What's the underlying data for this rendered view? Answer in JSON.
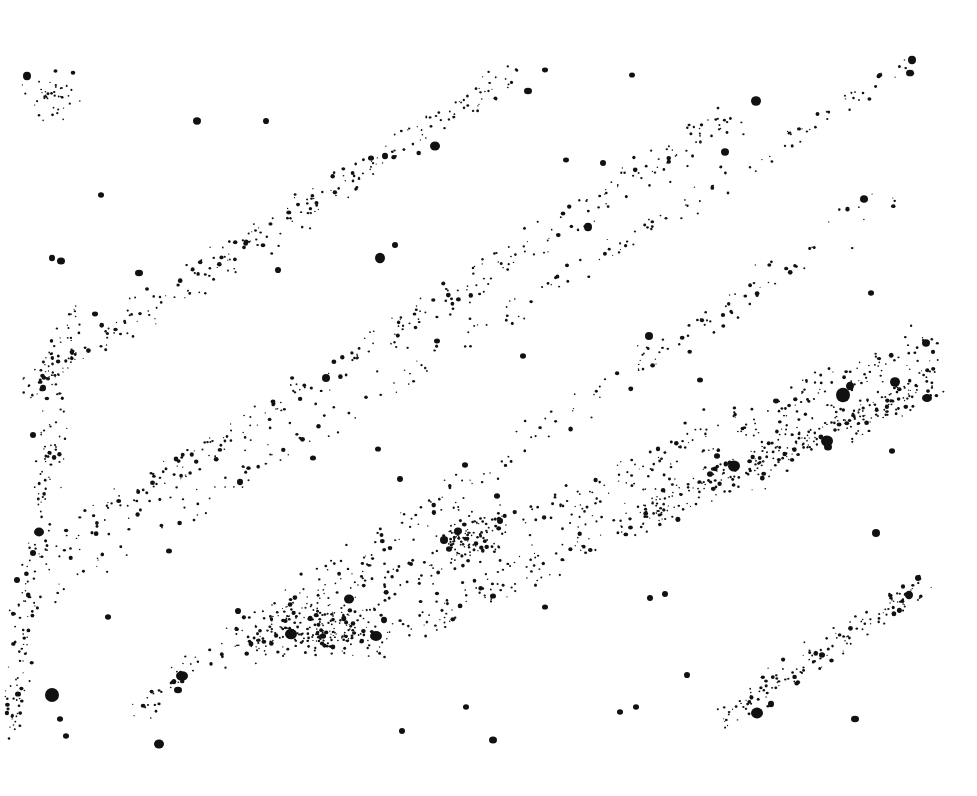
{
  "image": {
    "description": "Stippled ink-dot drawing of a star field; dots arranged in diagonal streams rising from lower-left to upper-right",
    "background": "#ffffff",
    "ink": "#111111",
    "width": 977,
    "height": 796
  },
  "large_dots": [
    [
      27,
      76,
      4
    ],
    [
      197,
      121,
      4
    ],
    [
      266,
      121,
      3
    ],
    [
      435,
      146,
      5
    ],
    [
      528,
      91,
      4
    ],
    [
      545,
      70,
      3
    ],
    [
      632,
      75,
      3
    ],
    [
      756,
      101,
      5
    ],
    [
      725,
      152,
      4
    ],
    [
      912,
      60,
      4
    ],
    [
      910,
      73,
      4
    ],
    [
      101,
      195,
      3
    ],
    [
      61,
      261,
      4
    ],
    [
      52,
      258,
      3
    ],
    [
      139,
      273,
      4
    ],
    [
      95,
      314,
      3
    ],
    [
      380,
      258,
      5
    ],
    [
      395,
      245,
      3
    ],
    [
      278,
      270,
      3
    ],
    [
      588,
      227,
      4
    ],
    [
      603,
      163,
      3
    ],
    [
      566,
      160,
      3
    ],
    [
      371,
      158,
      3
    ],
    [
      385,
      156,
      3
    ],
    [
      864,
      199,
      4
    ],
    [
      871,
      293,
      3
    ],
    [
      649,
      336,
      4
    ],
    [
      437,
      341,
      3
    ],
    [
      523,
      356,
      3
    ],
    [
      326,
      378,
      4
    ],
    [
      43,
      388,
      3
    ],
    [
      33,
      435,
      3
    ],
    [
      926,
      343,
      4
    ],
    [
      843,
      395,
      7
    ],
    [
      850,
      386,
      4
    ],
    [
      827,
      441,
      6
    ],
    [
      828,
      447,
      4
    ],
    [
      895,
      382,
      5
    ],
    [
      927,
      398,
      5
    ],
    [
      776,
      401,
      3
    ],
    [
      734,
      466,
      6
    ],
    [
      710,
      474,
      3
    ],
    [
      700,
      380,
      3
    ],
    [
      717,
      456,
      3
    ],
    [
      892,
      451,
      3
    ],
    [
      876,
      533,
      4
    ],
    [
      909,
      595,
      4
    ],
    [
      918,
      578,
      3
    ],
    [
      378,
      449,
      3
    ],
    [
      313,
      458,
      3
    ],
    [
      400,
      479,
      3
    ],
    [
      465,
      465,
      3
    ],
    [
      497,
      496,
      3
    ],
    [
      500,
      521,
      3
    ],
    [
      458,
      531,
      4
    ],
    [
      449,
      549,
      3
    ],
    [
      444,
      540,
      4
    ],
    [
      240,
      482,
      3
    ],
    [
      169,
      551,
      3
    ],
    [
      39,
      532,
      5
    ],
    [
      33,
      553,
      3
    ],
    [
      17,
      580,
      3
    ],
    [
      349,
      599,
      5
    ],
    [
      291,
      634,
      6
    ],
    [
      376,
      636,
      6
    ],
    [
      323,
      636,
      3
    ],
    [
      384,
      620,
      3
    ],
    [
      493,
      596,
      3
    ],
    [
      545,
      607,
      3
    ],
    [
      650,
      598,
      3
    ],
    [
      665,
      594,
      3
    ],
    [
      687,
      675,
      3
    ],
    [
      238,
      611,
      3
    ],
    [
      108,
      617,
      3
    ],
    [
      182,
      676,
      6
    ],
    [
      178,
      690,
      4
    ],
    [
      52,
      695,
      7
    ],
    [
      66,
      736,
      3
    ],
    [
      159,
      744,
      5
    ],
    [
      18,
      694,
      3
    ],
    [
      60,
      719,
      3
    ],
    [
      493,
      740,
      4
    ],
    [
      466,
      707,
      3
    ],
    [
      402,
      731,
      3
    ],
    [
      757,
      713,
      6
    ],
    [
      771,
      704,
      3
    ],
    [
      855,
      719,
      4
    ],
    [
      822,
      655,
      3
    ],
    [
      636,
      707,
      3
    ],
    [
      620,
      712,
      3
    ]
  ],
  "small_dot_regions": [
    {
      "name": "top-left-cluster",
      "cx": 50,
      "cy": 95,
      "rx": 40,
      "ry": 35,
      "count": 40
    },
    {
      "name": "stream-1",
      "x1": 20,
      "y1": 390,
      "x2": 520,
      "y2": 70,
      "width": 45,
      "count": 260
    },
    {
      "name": "stream-2",
      "x1": 40,
      "y1": 560,
      "x2": 740,
      "y2": 110,
      "width": 55,
      "count": 300
    },
    {
      "name": "stream-3",
      "x1": 10,
      "y1": 620,
      "x2": 920,
      "y2": 60,
      "width": 40,
      "count": 180
    },
    {
      "name": "stream-4",
      "x1": 120,
      "y1": 720,
      "x2": 900,
      "y2": 190,
      "width": 50,
      "count": 220
    },
    {
      "name": "stream-5",
      "x1": 240,
      "y1": 650,
      "x2": 940,
      "y2": 340,
      "width": 70,
      "count": 320
    },
    {
      "name": "stream-6",
      "x1": 420,
      "y1": 620,
      "x2": 930,
      "y2": 380,
      "width": 60,
      "count": 240
    },
    {
      "name": "stream-7",
      "x1": 640,
      "y1": 520,
      "x2": 940,
      "y2": 380,
      "width": 55,
      "count": 200
    },
    {
      "name": "stream-8",
      "x1": 720,
      "y1": 720,
      "x2": 930,
      "y2": 580,
      "width": 40,
      "count": 140
    },
    {
      "name": "lower-spiral",
      "cx": 330,
      "cy": 630,
      "rx": 110,
      "ry": 40,
      "count": 220
    },
    {
      "name": "mid-cluster",
      "cx": 470,
      "cy": 535,
      "rx": 50,
      "ry": 35,
      "count": 90
    },
    {
      "name": "left-edge",
      "x1": 10,
      "y1": 740,
      "x2": 70,
      "y2": 300,
      "width": 40,
      "count": 160
    }
  ]
}
